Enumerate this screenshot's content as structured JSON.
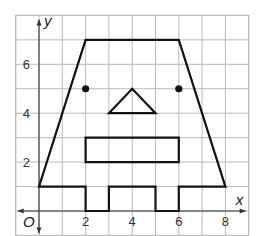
{
  "diagram": {
    "type": "coordinate-plane-figure",
    "axes": {
      "x_label": "x",
      "y_label": "y",
      "origin_label": "O",
      "x_range": [
        -1,
        9
      ],
      "y_range": [
        -1,
        8
      ],
      "grid_step": 1,
      "x_ticks": [
        2,
        4,
        6,
        8
      ],
      "y_ticks": [
        2,
        4,
        6
      ],
      "x_tick_labels": [
        "2",
        "4",
        "6",
        "8"
      ],
      "y_tick_labels": [
        "2",
        "4",
        "6"
      ]
    },
    "figure": {
      "outline": [
        [
          2,
          7
        ],
        [
          6,
          7
        ],
        [
          8,
          1
        ],
        [
          6,
          1
        ],
        [
          6,
          0
        ],
        [
          5,
          0
        ],
        [
          5,
          1
        ],
        [
          3,
          1
        ],
        [
          3,
          0
        ],
        [
          2,
          0
        ],
        [
          2,
          1
        ],
        [
          0,
          1
        ]
      ],
      "eyes": [
        [
          2,
          5
        ],
        [
          6,
          5
        ]
      ],
      "nose_triangle": [
        [
          3,
          4
        ],
        [
          4,
          5
        ],
        [
          5,
          4
        ]
      ],
      "mouth_rectangle": [
        [
          2,
          2
        ],
        [
          6,
          2
        ],
        [
          6,
          3
        ],
        [
          2,
          3
        ]
      ]
    },
    "colors": {
      "grid": "#b9b9b9",
      "shape": "#111111",
      "axis": "#333333"
    }
  }
}
